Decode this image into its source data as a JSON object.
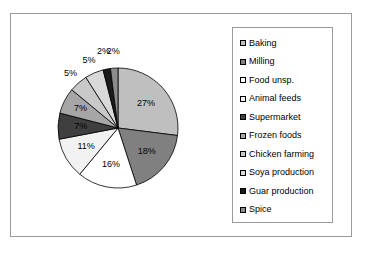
{
  "chart_data": {
    "type": "pie",
    "title": "",
    "legend_position": "right",
    "grid": false,
    "categories": [
      "Baking",
      "Milling",
      "Food unsp.",
      "Animal feeds",
      "Supermarket",
      "Frozen foods",
      "Chicken farming",
      "Soya production",
      "Guar production",
      "Spice"
    ],
    "values": [
      27,
      18,
      16,
      11,
      7,
      7,
      5,
      5,
      2,
      2
    ],
    "value_labels": [
      "27%",
      "18%",
      "16%",
      "11%",
      "7%",
      "7%",
      "5%",
      "5%",
      "2%",
      "2%"
    ],
    "colors": [
      "#BFBFBF",
      "#808080",
      "#FFFFFF",
      "#F2F2F2",
      "#3F3F3F",
      "#A6A6A6",
      "#C9C9C9",
      "#D9D9D9",
      "#1A1A1A",
      "#8C8C8C"
    ],
    "slices": [
      {
        "label": "Baking",
        "value": 27,
        "display": "27%",
        "color": "#BFBFBF"
      },
      {
        "label": "Milling",
        "value": 18,
        "display": "18%",
        "color": "#808080"
      },
      {
        "label": "Food unsp.",
        "value": 16,
        "display": "16%",
        "color": "#FFFFFF"
      },
      {
        "label": "Animal feeds",
        "value": 11,
        "display": "11%",
        "color": "#F2F2F2"
      },
      {
        "label": "Supermarket",
        "value": 7,
        "display": "7%",
        "color": "#3F3F3F"
      },
      {
        "label": "Frozen foods",
        "value": 7,
        "display": "7%",
        "color": "#A6A6A6"
      },
      {
        "label": "Chicken farming",
        "value": 5,
        "display": "5%",
        "color": "#C9C9C9"
      },
      {
        "label": "Soya production",
        "value": 5,
        "display": "5%",
        "color": "#D9D9D9"
      },
      {
        "label": "Guar production",
        "value": 2,
        "display": "2%",
        "color": "#1A1A1A"
      },
      {
        "label": "Spice",
        "value": 2,
        "display": "2%",
        "color": "#8C8C8C"
      }
    ]
  },
  "legend": {
    "items": [
      {
        "label": "Baking",
        "color": "#BFBFBF"
      },
      {
        "label": "Milling",
        "color": "#808080"
      },
      {
        "label": "Food unsp.",
        "color": "#FFFFFF"
      },
      {
        "label": "Animal feeds",
        "color": "#F2F2F2"
      },
      {
        "label": "Supermarket",
        "color": "#3F3F3F"
      },
      {
        "label": "Frozen foods",
        "color": "#A6A6A6"
      },
      {
        "label": "Chicken farming",
        "color": "#C9C9C9"
      },
      {
        "label": "Soya production",
        "color": "#D9D9D9"
      },
      {
        "label": "Guar production",
        "color": "#1A1A1A"
      },
      {
        "label": "Spice",
        "color": "#8C8C8C"
      }
    ]
  }
}
